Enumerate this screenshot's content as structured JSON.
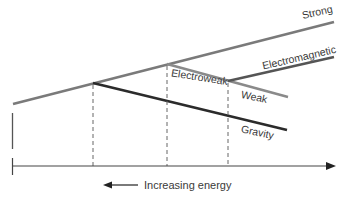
{
  "diagram": {
    "title": "",
    "labels": {
      "strong": "Strong",
      "electromagnetic": "Electromagnetic",
      "electroweak": "Electroweak",
      "weak": "Weak",
      "gravity": "Gravity"
    },
    "axis": {
      "label": "Increasing energy",
      "direction": "left"
    },
    "colors": {
      "strong": "#7a7a7a",
      "electroweak": "#8a8a8a",
      "weak": "#8a8a8a",
      "electromagnetic": "#555555",
      "gravity": "#2b2b2b",
      "axis": "#444444",
      "dashed": "#666666"
    }
  }
}
